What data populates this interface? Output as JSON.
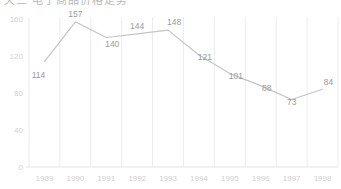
{
  "title": {
    "text": "天三  电子商品价格走势",
    "clipped": true
  },
  "chart_data": {
    "type": "line",
    "title": "",
    "xlabel": "",
    "ylabel": "",
    "categories": [
      "1989",
      "1990",
      "1991",
      "1992",
      "1993",
      "1994",
      "1995",
      "1996",
      "1997",
      "1998"
    ],
    "values": [
      114,
      157,
      140,
      144,
      148,
      121,
      101,
      88,
      73,
      84
    ],
    "series": [
      {
        "name": "series-1",
        "values": [
          114,
          157,
          140,
          144,
          148,
          121,
          101,
          88,
          73,
          84
        ],
        "color": "#c4c4c4"
      }
    ],
    "ylim": [
      0,
      160
    ],
    "yticks": [
      0,
      40,
      80,
      120,
      160
    ],
    "ytick_labels": [
      "0",
      "40",
      "80",
      "120",
      "160"
    ],
    "xtick_labels": [
      "1989",
      "1990",
      "1991",
      "1992",
      "1993",
      "1994",
      "1995",
      "1996",
      "1997",
      "1998"
    ],
    "data_labels": [
      "114",
      "157",
      "140",
      "144",
      "148",
      "121",
      "101",
      "88",
      "73",
      "84"
    ],
    "grid": {
      "vertical": true,
      "horizontal": false
    },
    "legend": {
      "visible": false,
      "position": "none"
    },
    "colors": {
      "line": "#c4c4c4",
      "gridline": "#ececec",
      "axis": "#e4e4e4",
      "tick_text": "#d0d0d0",
      "label_text": "#9a9a9a",
      "background": "#ffffff"
    }
  }
}
